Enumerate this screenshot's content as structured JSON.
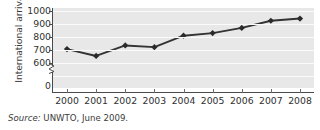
{
  "chart_data": {
    "type": "line",
    "title": "",
    "xlabel": "",
    "ylabel": "International arrivals",
    "categories": [
      "2000",
      "2001",
      "2002",
      "2003",
      "2004",
      "2005",
      "2006",
      "2007",
      "2008"
    ],
    "values": [
      687,
      634,
      715,
      702,
      790,
      810,
      850,
      905,
      922
    ],
    "series": [
      {
        "name": "International arrivals",
        "values": [
          687,
          634,
          715,
          702,
          790,
          810,
          850,
          905,
          922
        ]
      }
    ],
    "ytick_labels": [
      "1000",
      "900",
      "800",
      "700",
      "600",
      "0"
    ],
    "ytick_values": [
      1000,
      900,
      800,
      700,
      600,
      0
    ],
    "ylim": [
      600,
      1000
    ],
    "axis_break": true,
    "grid": "horizontal",
    "legend": "none",
    "marker": "diamond",
    "line_color": "#333333",
    "marker_color": "#2b2b2b",
    "plot_background": "#e8e8e8",
    "gridline_color": "#fbfbfb"
  },
  "source": {
    "prefix": "Source:",
    "text": "UNWTO, June 2009."
  }
}
